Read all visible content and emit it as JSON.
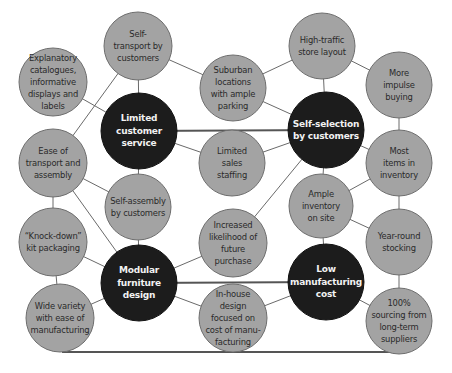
{
  "diagram": {
    "title": "",
    "colors": {
      "background": "#ffffff",
      "secondary_fill": "#a3a3a3",
      "secondary_stroke": "#6e6e6e",
      "primary_fill": "#1c1c1c",
      "primary_stroke": "#111111",
      "line": "#6a6a6a",
      "thick_line": "#555555"
    },
    "nodes": [
      {
        "id": "explanatory",
        "label": "Explanatory\ncatalogues,\ninformative\ndisplays and\nlabels",
        "type": "secondary",
        "cx": 53,
        "cy": 82,
        "r": 34
      },
      {
        "id": "self-transport",
        "label": "Self-\ntransport by\ncustomers",
        "type": "secondary",
        "cx": 138,
        "cy": 46,
        "r": 34
      },
      {
        "id": "suburban",
        "label": "Suburban\nlocations\nwith ample\nparking",
        "type": "secondary",
        "cx": 233,
        "cy": 88,
        "r": 33
      },
      {
        "id": "high-traffic",
        "label": "High-traffic\nstore layout",
        "type": "secondary",
        "cx": 322,
        "cy": 46,
        "r": 33
      },
      {
        "id": "impulse",
        "label": "More\nimpulse\nbuying",
        "type": "secondary",
        "cx": 399,
        "cy": 85,
        "r": 33
      },
      {
        "id": "limited-service",
        "label": "Limited\ncustomer\nservice",
        "type": "primary",
        "cx": 139,
        "cy": 131,
        "r": 38
      },
      {
        "id": "self-selection",
        "label": "Self-selection\nby customers",
        "type": "primary",
        "cx": 326,
        "cy": 130,
        "r": 38
      },
      {
        "id": "ease-transport",
        "label": "Ease of\ntransport and\nassembly",
        "type": "secondary",
        "cx": 53,
        "cy": 163,
        "r": 34
      },
      {
        "id": "limited-sales",
        "label": "Limited\nsales\nstaffing",
        "type": "secondary",
        "cx": 232,
        "cy": 163,
        "r": 33
      },
      {
        "id": "most-items",
        "label": "Most\nitems in\ninventory",
        "type": "secondary",
        "cx": 399,
        "cy": 163,
        "r": 33
      },
      {
        "id": "self-assembly",
        "label": "Self-assembly\nby customers",
        "type": "secondary",
        "cx": 138,
        "cy": 207,
        "r": 33
      },
      {
        "id": "ample-inventory",
        "label": "Ample\ninventory\non site",
        "type": "secondary",
        "cx": 321,
        "cy": 206,
        "r": 32
      },
      {
        "id": "knock-down",
        "label": "“Knock-down”\nkit packaging",
        "type": "secondary",
        "cx": 53,
        "cy": 242,
        "r": 34
      },
      {
        "id": "increased-likelihood",
        "label": "Increased\nlikelihood of\nfuture\npurchase",
        "type": "secondary",
        "cx": 233,
        "cy": 243,
        "r": 34
      },
      {
        "id": "year-round",
        "label": "Year-round\nstocking",
        "type": "secondary",
        "cx": 399,
        "cy": 242,
        "r": 33
      },
      {
        "id": "modular",
        "label": "Modular\nfurniture\ndesign",
        "type": "primary",
        "cx": 139,
        "cy": 283,
        "r": 38
      },
      {
        "id": "low-cost",
        "label": "Low\nmanufacturing\ncost",
        "type": "primary",
        "cx": 326,
        "cy": 282,
        "r": 38
      },
      {
        "id": "wide-variety",
        "label": "Wide variety\nwith ease of\nmanufacturing",
        "type": "secondary",
        "cx": 60,
        "cy": 318,
        "r": 34
      },
      {
        "id": "in-house",
        "label": "In-house\ndesign\nfocused on\ncost of manu-\nfacturing",
        "type": "secondary",
        "cx": 233,
        "cy": 318,
        "r": 34
      },
      {
        "id": "sourcing",
        "label": "100%\nsourcing from\nlong-term\nsuppliers",
        "type": "secondary",
        "cx": 399,
        "cy": 321,
        "r": 33
      }
    ],
    "edges": [
      {
        "from": "explanatory",
        "to": "limited-service",
        "weight": "thin"
      },
      {
        "from": "self-transport",
        "to": "limited-service",
        "weight": "thin"
      },
      {
        "from": "self-transport",
        "to": "suburban",
        "weight": "thin"
      },
      {
        "from": "self-transport",
        "to": "ease-transport",
        "weight": "thin"
      },
      {
        "from": "suburban",
        "to": "high-traffic",
        "weight": "thin"
      },
      {
        "from": "suburban",
        "to": "self-selection",
        "weight": "thin"
      },
      {
        "from": "high-traffic",
        "to": "impulse",
        "weight": "thin"
      },
      {
        "from": "high-traffic",
        "to": "self-selection",
        "weight": "thin"
      },
      {
        "from": "impulse",
        "to": "most-items",
        "weight": "thin"
      },
      {
        "from": "limited-service",
        "to": "self-selection",
        "weight": "thick"
      },
      {
        "from": "limited-service",
        "to": "limited-sales",
        "weight": "thin"
      },
      {
        "from": "limited-service",
        "to": "self-assembly",
        "weight": "thin"
      },
      {
        "from": "limited-sales",
        "to": "self-selection",
        "weight": "thin"
      },
      {
        "from": "self-selection",
        "to": "most-items",
        "weight": "thin"
      },
      {
        "from": "self-selection",
        "to": "ample-inventory",
        "weight": "thin"
      },
      {
        "from": "self-selection",
        "to": "increased-likelihood",
        "weight": "thin"
      },
      {
        "from": "ease-transport",
        "to": "self-assembly",
        "weight": "thin"
      },
      {
        "from": "ease-transport",
        "to": "knock-down",
        "weight": "thin"
      },
      {
        "from": "ease-transport",
        "to": "modular",
        "weight": "thin"
      },
      {
        "from": "most-items",
        "to": "ample-inventory",
        "weight": "thin"
      },
      {
        "from": "most-items",
        "to": "year-round",
        "weight": "thin"
      },
      {
        "from": "self-assembly",
        "to": "modular",
        "weight": "thin"
      },
      {
        "from": "ample-inventory",
        "to": "year-round",
        "weight": "thin"
      },
      {
        "from": "ample-inventory",
        "to": "low-cost",
        "weight": "thin"
      },
      {
        "from": "knock-down",
        "to": "modular",
        "weight": "thin"
      },
      {
        "from": "knock-down",
        "to": "wide-variety",
        "weight": "thin"
      },
      {
        "from": "increased-likelihood",
        "to": "modular",
        "weight": "thin"
      },
      {
        "from": "year-round",
        "to": "sourcing",
        "weight": "thin"
      },
      {
        "from": "modular",
        "to": "low-cost",
        "weight": "thick"
      },
      {
        "from": "modular",
        "to": "wide-variety",
        "weight": "thin"
      },
      {
        "from": "modular",
        "to": "in-house",
        "weight": "thin"
      },
      {
        "from": "low-cost",
        "to": "in-house",
        "weight": "thin"
      },
      {
        "from": "low-cost",
        "to": "sourcing",
        "weight": "thin"
      }
    ],
    "bottom_line": {
      "x1": 62,
      "y1": 352,
      "x2": 400,
      "y2": 352,
      "from": "wide-variety",
      "to": "sourcing"
    }
  }
}
